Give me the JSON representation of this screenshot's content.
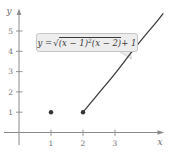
{
  "figure_title": "graph-of-square-root-function",
  "axes": {
    "x_label": "x",
    "y_label": "y",
    "x_ticks": [
      1,
      2,
      3
    ],
    "y_ticks": [
      1,
      2,
      3,
      4,
      5
    ]
  },
  "formula": {
    "lhs": "y = ",
    "radical_sign": "√",
    "radicand_1": "(x − 1)",
    "radicand_exp": "2",
    "radicand_2": "(x − 2)",
    "suffix": " + 1"
  },
  "chart_data": {
    "type": "line",
    "title": "",
    "xlabel": "x",
    "ylabel": "y",
    "function": "y = sqrt((x-1)^2 (x-2)) + 1",
    "xlim": [
      0,
      4.7
    ],
    "ylim": [
      0,
      6.2
    ],
    "x_ticks": [
      1,
      2,
      3
    ],
    "y_ticks": [
      1,
      2,
      3,
      4,
      5
    ],
    "grid": false,
    "curve_domain": [
      2,
      4.5
    ],
    "curve_points": [
      [
        2,
        1
      ],
      [
        2.5,
        1.95
      ],
      [
        3,
        2.9
      ],
      [
        3.5,
        3.92
      ],
      [
        3.95,
        4.8
      ],
      [
        4.3,
        5.45
      ],
      [
        4.5,
        5.85
      ]
    ],
    "isolated_points": [
      [
        1,
        1
      ],
      [
        2,
        1
      ]
    ],
    "annotation": "y = √((x − 1)²(x − 2)) + 1"
  },
  "colors": {
    "curve": "#3d3d3d",
    "points": "#333333",
    "axis": "#8a8a8a",
    "tick_text": "#6e6e6e",
    "callout_bg": "#ededed",
    "callout_border": "#c6c6c6",
    "formula_text": "#3a3a3a"
  }
}
